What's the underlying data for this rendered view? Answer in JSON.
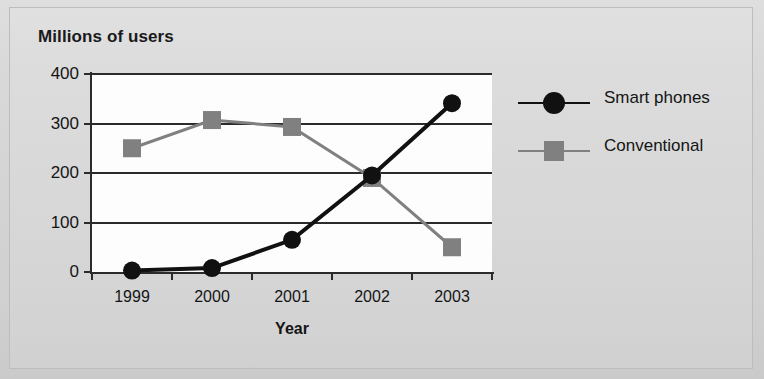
{
  "chart_data": {
    "type": "line",
    "title": "Millions of users",
    "xlabel": "Year",
    "ylabel": "",
    "categories": [
      "1999",
      "2000",
      "2001",
      "2002",
      "2003"
    ],
    "ylim": [
      0,
      400
    ],
    "yticks": [
      0,
      100,
      200,
      300,
      400
    ],
    "ytick_labels": [
      "0",
      "100",
      "200",
      "300",
      "400"
    ],
    "grid": true,
    "legend_position": "right",
    "series": [
      {
        "name": "Smart phones",
        "marker": "circle",
        "color": "#111111",
        "values": [
          3,
          8,
          65,
          195,
          341
        ]
      },
      {
        "name": "Conventional",
        "marker": "square",
        "color": "#808080",
        "values": [
          250,
          307,
          293,
          190,
          50
        ]
      }
    ]
  },
  "legend": {
    "items": [
      {
        "label": "Smart phones"
      },
      {
        "label": "Conventional"
      }
    ]
  }
}
